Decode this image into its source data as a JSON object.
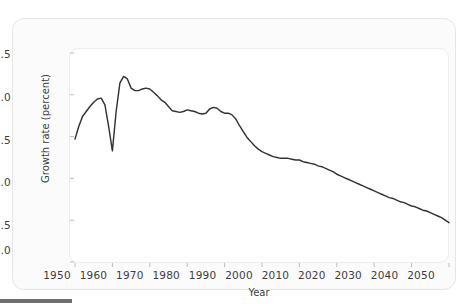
{
  "figure": {
    "panel_background": "#ffffff",
    "card_background": "#fbfbfb",
    "line_color": "#333333",
    "tick_color": "#bdbdbd"
  },
  "axes": {
    "y_label": "Growth rate (percent)",
    "x_label": "Year",
    "y_ticks": [
      "0.0",
      "0.5",
      "1.0",
      "1.5",
      "2.0",
      "2.5"
    ],
    "x_ticks": [
      "1950",
      "1960",
      "1970",
      "1980",
      "1990",
      "2000",
      "2010",
      "2020",
      "2030",
      "2040",
      "2050"
    ]
  },
  "chart_data": {
    "type": "line",
    "title": "",
    "xlabel": "Year",
    "ylabel": "Growth rate (percent)",
    "xlim": [
      1950,
      2050
    ],
    "ylim": [
      0.0,
      2.5
    ],
    "yticks": [
      0.0,
      0.5,
      1.0,
      1.5,
      2.0,
      2.5
    ],
    "xticks": [
      1950,
      1960,
      1970,
      1980,
      1990,
      2000,
      2010,
      2020,
      2030,
      2040,
      2050
    ],
    "grid": false,
    "legend": "none",
    "series": [
      {
        "name": "World population growth rate",
        "x": [
          1950,
          1951,
          1952,
          1953,
          1954,
          1955,
          1956,
          1957,
          1958,
          1959,
          1960,
          1961,
          1962,
          1963,
          1964,
          1965,
          1966,
          1967,
          1968,
          1969,
          1970,
          1971,
          1972,
          1973,
          1974,
          1975,
          1976,
          1977,
          1978,
          1979,
          1980,
          1981,
          1982,
          1983,
          1984,
          1985,
          1986,
          1987,
          1988,
          1989,
          1990,
          1991,
          1992,
          1993,
          1994,
          1995,
          1996,
          1997,
          1998,
          1999,
          2000,
          2001,
          2002,
          2003,
          2004,
          2005,
          2006,
          2007,
          2008,
          2009,
          2010,
          2011,
          2012,
          2013,
          2014,
          2015,
          2016,
          2017,
          2018,
          2019,
          2020,
          2021,
          2022,
          2023,
          2024,
          2025,
          2026,
          2027,
          2028,
          2029,
          2030,
          2031,
          2032,
          2033,
          2034,
          2035,
          2036,
          2037,
          2038,
          2039,
          2040,
          2041,
          2042,
          2043,
          2044,
          2045,
          2046,
          2047,
          2048,
          2049,
          2050
        ],
        "y": [
          1.47,
          1.62,
          1.74,
          1.8,
          1.86,
          1.91,
          1.95,
          1.96,
          1.88,
          1.62,
          1.33,
          1.8,
          2.14,
          2.22,
          2.19,
          2.08,
          2.05,
          2.05,
          2.07,
          2.08,
          2.07,
          2.03,
          1.99,
          1.94,
          1.91,
          1.86,
          1.81,
          1.8,
          1.79,
          1.8,
          1.82,
          1.81,
          1.8,
          1.78,
          1.77,
          1.78,
          1.83,
          1.85,
          1.84,
          1.8,
          1.78,
          1.78,
          1.76,
          1.71,
          1.63,
          1.56,
          1.49,
          1.44,
          1.39,
          1.35,
          1.32,
          1.3,
          1.28,
          1.26,
          1.25,
          1.24,
          1.24,
          1.24,
          1.23,
          1.22,
          1.22,
          1.2,
          1.19,
          1.18,
          1.17,
          1.15,
          1.14,
          1.12,
          1.1,
          1.08,
          1.05,
          1.03,
          1.01,
          0.99,
          0.97,
          0.95,
          0.93,
          0.91,
          0.89,
          0.87,
          0.85,
          0.83,
          0.81,
          0.79,
          0.77,
          0.76,
          0.74,
          0.72,
          0.71,
          0.69,
          0.67,
          0.66,
          0.64,
          0.62,
          0.61,
          0.59,
          0.57,
          0.55,
          0.53,
          0.5,
          0.47
        ]
      }
    ],
    "annotations": [
      {
        "note": "dip to 1.33 around 1960 (Great Chinese Famine)"
      },
      {
        "note": "peak 2.22 around 1963"
      },
      {
        "note": "decline to 0.47 by 2050"
      }
    ]
  }
}
